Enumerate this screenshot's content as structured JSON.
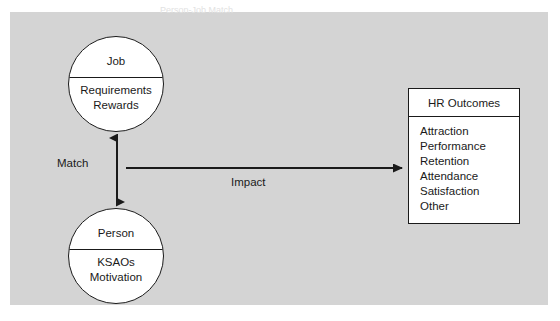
{
  "caption": {
    "text": "Person-Job Match"
  },
  "panel": {
    "background_color": "#d4d4d4",
    "line_color": "#1a1a1a",
    "node_fill_color": "#ffffff"
  },
  "nodes": {
    "job": {
      "title": "Job",
      "attributes": [
        "Requirements",
        "Rewards"
      ],
      "attributes_text": "Requirements\nRewards"
    },
    "person": {
      "title": "Person",
      "attributes": [
        "KSAOs",
        "Motivation"
      ],
      "attributes_text": "KSAOs\nMotivation"
    }
  },
  "hr_outcomes": {
    "header": "HR Outcomes",
    "items": [
      "Attraction",
      "Performance",
      "Retention",
      "Attendance",
      "Satisfaction",
      "Other"
    ]
  },
  "arrows": {
    "match": {
      "label": "Match",
      "direction": "bidirectional-vertical"
    },
    "impact": {
      "label": "Impact",
      "direction": "right"
    }
  }
}
